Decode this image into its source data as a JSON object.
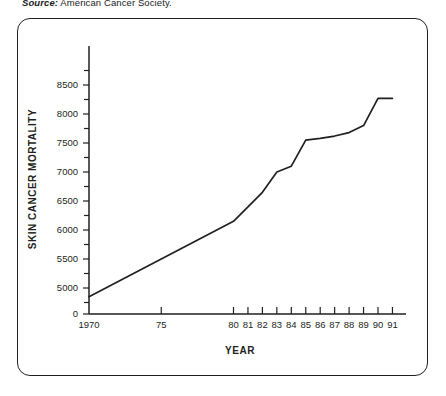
{
  "source": {
    "label": "Source:",
    "text": " American Cancer Society."
  },
  "chart_data": {
    "type": "line",
    "title": "",
    "xlabel": "YEAR",
    "ylabel": "SKIN CANCER MORTALITY",
    "x": [
      1970,
      1980,
      1981,
      1982,
      1983,
      1984,
      1985,
      1986,
      1987,
      1988,
      1989,
      1990,
      1991
    ],
    "values": [
      4850,
      6150,
      6400,
      6650,
      7000,
      7100,
      7550,
      7580,
      7620,
      7680,
      7800,
      8270,
      8270
    ],
    "xtick_labels": [
      "1970",
      "75",
      "80",
      "81",
      "82",
      "83",
      "84",
      "85",
      "86",
      "87",
      "88",
      "89",
      "90",
      "91"
    ],
    "xtick_years": [
      1970,
      1975,
      1980,
      1981,
      1982,
      1983,
      1984,
      1985,
      1986,
      1987,
      1988,
      1989,
      1990,
      1991
    ],
    "ytick_labels": [
      "8500",
      "8000",
      "7500",
      "7000",
      "6500",
      "6000",
      "5500",
      "5000",
      "0"
    ],
    "ytick_values": [
      8500,
      8000,
      7500,
      7000,
      6500,
      6000,
      5500,
      5000,
      0
    ],
    "yminor_values": [
      8750,
      8250,
      7750,
      7250,
      6750,
      6250,
      5750,
      5250,
      4750
    ],
    "ylim": [
      4500,
      8900
    ],
    "xlim": [
      1970,
      1991
    ],
    "axis_break": true,
    "grid": false,
    "legend": null,
    "line_color": "#231f20"
  }
}
